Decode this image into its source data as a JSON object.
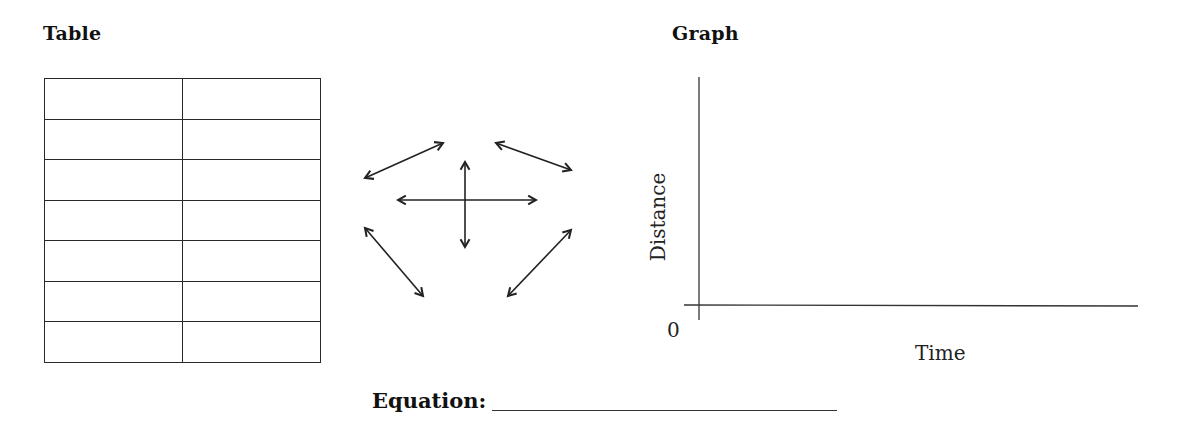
{
  "table_section": {
    "heading": "Table",
    "rows": [
      [
        "",
        ""
      ],
      [
        "",
        ""
      ],
      [
        "",
        ""
      ],
      [
        "",
        ""
      ],
      [
        "",
        ""
      ],
      [
        "",
        ""
      ],
      [
        "",
        ""
      ]
    ]
  },
  "arrows_diagram": {
    "arrows": [
      {
        "name": "upper-left",
        "from": [
          365,
          178
        ],
        "to": [
          443,
          143
        ]
      },
      {
        "name": "upper-right",
        "from": [
          496,
          143
        ],
        "to": [
          571,
          170
        ]
      },
      {
        "name": "horizontal",
        "from": [
          398,
          200
        ],
        "to": [
          536,
          200
        ]
      },
      {
        "name": "vertical",
        "from": [
          465,
          162
        ],
        "to": [
          465,
          247
        ]
      },
      {
        "name": "lower-left",
        "from": [
          365,
          228
        ],
        "to": [
          423,
          296
        ]
      },
      {
        "name": "lower-right",
        "from": [
          571,
          230
        ],
        "to": [
          508,
          296
        ]
      }
    ]
  },
  "graph_section": {
    "heading": "Graph",
    "y_axis_label": "Distance",
    "x_axis_label": "Time",
    "origin_label": "0"
  },
  "equation": {
    "label": "Equation:",
    "value": ""
  },
  "chart_data": {
    "type": "line",
    "title": "Graph",
    "xlabel": "Time",
    "ylabel": "Distance",
    "x": [],
    "series": [],
    "origin_tick": "0",
    "grid": false
  }
}
